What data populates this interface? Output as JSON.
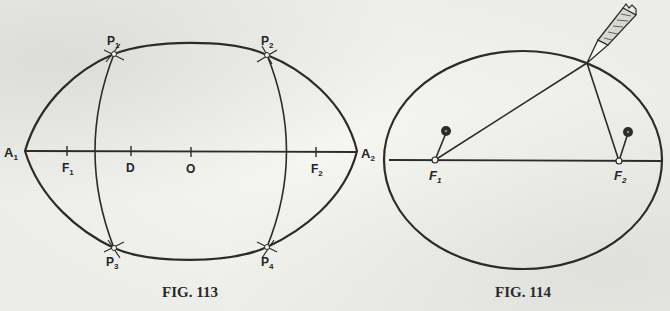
{
  "figures": [
    {
      "caption": "Fig. 113",
      "caption_display": "FIG. 113",
      "labels": {
        "A1": "A",
        "A1_sub": "1",
        "A2": "A",
        "A2_sub": "2",
        "F1": "F",
        "F1_sub": "1",
        "F2": "F",
        "F2_sub": "2",
        "D": "D",
        "O": "O",
        "P1": "P",
        "P1_sub": "1",
        "P2": "P",
        "P2_sub": "2",
        "P3": "P",
        "P3_sub": "3",
        "P4": "P",
        "P4_sub": "4"
      },
      "description": "Ellipse construction with major axis A1A2, foci F1 and F2, center O, point D, and intersecting arcs locating points P1–P4"
    },
    {
      "caption": "Fig. 114",
      "caption_display": "FIG. 114",
      "labels": {
        "F1": "F",
        "F1_sub": "1",
        "F2": "F",
        "F2_sub": "2"
      },
      "description": "String-and-pins method: pins at foci F1 and F2, string looped around a pencil tracing the ellipse"
    }
  ],
  "colors": {
    "ink": "#2b2b2b",
    "paper": "#ececE8"
  }
}
